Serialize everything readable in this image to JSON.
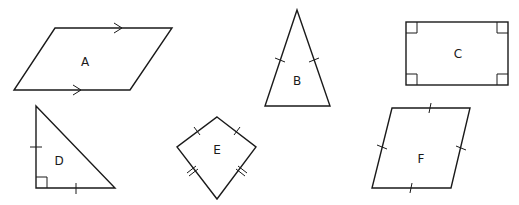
{
  "shapes": [
    {
      "id": "A",
      "label": "A",
      "kind": "parallelogram",
      "markings": "parallel-arrows on top and bottom sides"
    },
    {
      "id": "B",
      "label": "B",
      "kind": "isosceles-triangle",
      "markings": "single tick on each equal side"
    },
    {
      "id": "C",
      "label": "C",
      "kind": "rectangle",
      "markings": "right-angle marks at four corners"
    },
    {
      "id": "D",
      "label": "D",
      "kind": "right-isosceles-triangle",
      "markings": "right-angle mark, single tick on each leg"
    },
    {
      "id": "E",
      "label": "E",
      "kind": "kite",
      "markings": "single ticks on upper sides, double ticks on lower sides"
    },
    {
      "id": "F",
      "label": "F",
      "kind": "rhombus",
      "markings": "single tick on each of four sides"
    }
  ],
  "colors": {
    "stroke": "#1a1a1a",
    "background": "#ffffff"
  }
}
